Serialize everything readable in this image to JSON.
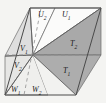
{
  "figure": {
    "type": "geometric-diagram",
    "background_color": "#f4f4f2",
    "outline_color": "#4a4a4a",
    "dashed_color": "#8c8c8c",
    "fills": {
      "dark_gray": "#a9a9a9",
      "mid_gray": "#c2c2c2",
      "light_gray": "#dcdcdc",
      "pale_gray": "#ececea",
      "white": "#fbfbfa"
    },
    "labels": [
      {
        "id": "U2",
        "base": "U",
        "sub": "2",
        "x": 38,
        "y": 11
      },
      {
        "id": "U1",
        "base": "U",
        "sub": "1",
        "x": 62,
        "y": 11
      },
      {
        "id": "T2",
        "base": "T",
        "sub": "2",
        "x": 70,
        "y": 40
      },
      {
        "id": "T1",
        "base": "T",
        "sub": "1",
        "x": 63,
        "y": 67
      },
      {
        "id": "V1",
        "base": "V",
        "sub": "1",
        "x": 20,
        "y": 45
      },
      {
        "id": "V2",
        "base": "V",
        "sub": "2",
        "x": 14,
        "y": 62
      },
      {
        "id": "W1",
        "base": "W",
        "sub": "1",
        "x": 11,
        "y": 86
      },
      {
        "id": "W2",
        "base": "W",
        "sub": "2",
        "x": 32,
        "y": 86
      }
    ],
    "vertices": {
      "top_left": [
        30,
        8
      ],
      "top_right": [
        101,
        8
      ],
      "center": [
        33,
        55
      ],
      "bottom_left": [
        5,
        95
      ],
      "bottom_right": [
        76,
        95
      ],
      "left_apex": [
        5,
        56
      ],
      "right_apex": [
        101,
        55
      ]
    }
  }
}
